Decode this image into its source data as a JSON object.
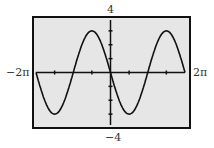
{
  "chart_data": {
    "type": "line",
    "title": "",
    "function": "y = -3 sin(x)",
    "xlim_label": [
      "-2π",
      "2π"
    ],
    "ylim_label": [
      "-4",
      "4"
    ],
    "xlim": [
      -6.2832,
      6.2832
    ],
    "ylim": [
      -4,
      4
    ],
    "x_ticks": [
      -4.712,
      -1.571,
      1.571,
      4.712
    ],
    "y_ticks": [
      -3,
      -2,
      -1,
      1,
      2,
      3
    ],
    "series": [
      {
        "name": "curve",
        "amplitude": 3,
        "period": 6.2832
      }
    ],
    "grid": false,
    "background": "#e6e6e6"
  },
  "labels": {
    "xmin": "−2π",
    "xmax": "2π",
    "ymax": "4",
    "ymin": "−4"
  }
}
